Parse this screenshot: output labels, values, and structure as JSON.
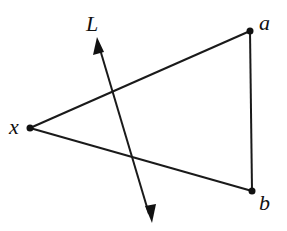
{
  "diagram": {
    "type": "geometry",
    "labels": {
      "line": "L",
      "a": "a",
      "b": "b",
      "x": "x"
    },
    "points": {
      "a": [
        250,
        31
      ],
      "b": [
        252,
        191
      ],
      "x": [
        30,
        128
      ]
    },
    "line_L": {
      "start": [
        97,
        38
      ],
      "end": [
        151,
        222
      ],
      "arrows": "both"
    },
    "segments": [
      [
        "x",
        "a"
      ],
      [
        "x",
        "b"
      ],
      [
        "a",
        "b"
      ]
    ],
    "colors": {
      "stroke": "#1a1a1a",
      "background": "#ffffff"
    }
  }
}
